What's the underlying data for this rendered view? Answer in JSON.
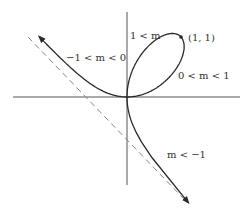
{
  "diagram": {
    "colors": {
      "axis": "#555555",
      "curve": "#2a2a2a",
      "asymptote": "#888888",
      "text": "#333333",
      "background": "#ffffff"
    },
    "origin_px": [
      127,
      97
    ],
    "axes": {
      "x_axis": {
        "x1": 13,
        "x2": 240,
        "y": 97
      },
      "y_axis": {
        "x": 127,
        "y1": 12,
        "y2": 185
      }
    },
    "asymptote": {
      "x1": 28,
      "y1": 37,
      "x2": 184,
      "y2": 199,
      "style": "dashed"
    },
    "point": {
      "label": "(1, 1)",
      "px": [
        181,
        37
      ]
    },
    "labels": [
      {
        "id": "one-lt-m",
        "text": "1 < m",
        "x": 130,
        "y": 39
      },
      {
        "id": "point-1-1",
        "text": "(1, 1)",
        "x": 188,
        "y": 41
      },
      {
        "id": "zero-lt-m-lt-one",
        "text": "0 < m < 1",
        "x": 178,
        "y": 79
      },
      {
        "id": "neg-one-lt-m-lt-zero",
        "text": "−1 < m < 0",
        "x": 66,
        "y": 61
      },
      {
        "id": "m-lt-neg-one",
        "text": "m < −1",
        "x": 167,
        "y": 158
      }
    ],
    "branches": [
      {
        "id": "loop-upper",
        "range": "1 < m"
      },
      {
        "id": "loop-lower",
        "range": "0 < m < 1"
      },
      {
        "id": "upper-left-branch",
        "range": "−1 < m < 0"
      },
      {
        "id": "lower-right-branch",
        "range": "m < −1"
      }
    ]
  }
}
